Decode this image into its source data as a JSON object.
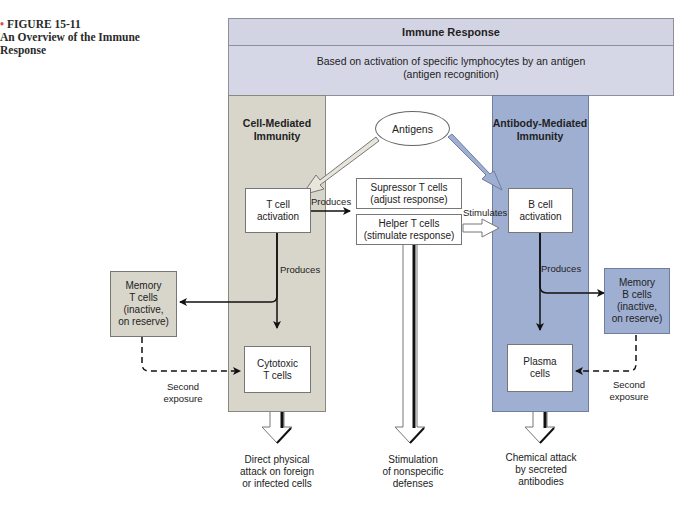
{
  "caption": {
    "bullet": "•",
    "figure_number": "FIGURE 15-11",
    "title_line1": "An Overview of the Immune",
    "title_line2": "Response"
  },
  "header": {
    "title": "Immune Response",
    "subtitle_line1": "Based on activation of specific lymphocytes by an antigen",
    "subtitle_line2": "(antigen recognition)"
  },
  "columns": {
    "cell_mediated": {
      "title_line1": "Cell-Mediated",
      "title_line2": "Immunity",
      "color": "#d8d5cb"
    },
    "antibody_mediated": {
      "title_line1": "Antibody-Mediated",
      "title_line2": "Immunity",
      "color": "#9fafd2"
    }
  },
  "nodes": {
    "antigens": "Antigens",
    "t_cell_activation": {
      "line1": "T cell",
      "line2": "activation"
    },
    "b_cell_activation": {
      "line1": "B cell",
      "line2": "activation"
    },
    "suppressor_t": {
      "line1": "Supressor T cells",
      "line2": "(adjust response)"
    },
    "helper_t": {
      "line1": "Helper T cells",
      "line2": "(stimulate response)"
    },
    "memory_t": {
      "line1": "Memory",
      "line2": "T cells",
      "line3": "(inactive,",
      "line4": "on reserve)"
    },
    "memory_b": {
      "line1": "Memory",
      "line2": "B cells",
      "line3": "(inactive,",
      "line4": "on reserve)"
    },
    "cytotoxic_t": {
      "line1": "Cytotoxic",
      "line2": "T cells"
    },
    "plasma": {
      "line1": "Plasma",
      "line2": "cells"
    }
  },
  "edge_labels": {
    "produces_t_to_helper": "Produces",
    "stimulates": "Stimulates",
    "produces_t": "Produces",
    "produces_b": "Produces",
    "second_exposure_left": {
      "line1": "Second",
      "line2": "exposure"
    },
    "second_exposure_right": {
      "line1": "Second",
      "line2": "exposure"
    }
  },
  "outcomes": {
    "cell": {
      "line1": "Direct physical",
      "line2": "attack on foreign",
      "line3": "or infected cells"
    },
    "helper": {
      "line1": "Stimulation",
      "line2": "of nonspecific",
      "line3": "defenses"
    },
    "antibody": {
      "line1": "Chemical attack",
      "line2": "by secreted",
      "line3": "antibodies"
    }
  }
}
